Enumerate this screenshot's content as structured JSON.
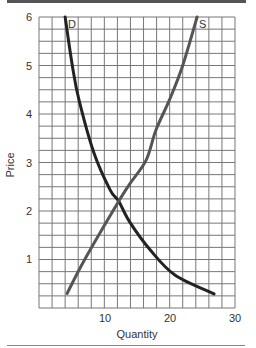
{
  "chart_data": {
    "type": "line",
    "title": "",
    "xlabel": "Quantity",
    "ylabel": "Price",
    "xlim": [
      0,
      30
    ],
    "ylim": [
      0,
      6
    ],
    "x_ticks": [
      10,
      20,
      30
    ],
    "y_ticks": [
      1,
      2,
      3,
      4,
      5,
      6
    ],
    "grid": true,
    "grid_x_step": 2,
    "grid_y_step": 0.25,
    "legend": "none (curves labeled inline)",
    "series": [
      {
        "name": "D",
        "label": "D",
        "color": "#222222",
        "points": [
          [
            4.0,
            6.0
          ],
          [
            5.1,
            5.0
          ],
          [
            6.1,
            4.3
          ],
          [
            8.4,
            3.2
          ],
          [
            10.9,
            2.43
          ],
          [
            12.2,
            2.2
          ],
          [
            13.9,
            1.77
          ],
          [
            17.0,
            1.2
          ],
          [
            20.8,
            0.68
          ],
          [
            26.8,
            0.29
          ]
        ]
      },
      {
        "name": "S",
        "label": "S",
        "color": "#555555",
        "points": [
          [
            4.3,
            0.3
          ],
          [
            7.0,
            1.0
          ],
          [
            12.2,
            2.2
          ],
          [
            13.9,
            2.56
          ],
          [
            16.4,
            3.05
          ],
          [
            17.9,
            3.67
          ],
          [
            20.0,
            4.3
          ],
          [
            22.0,
            5.0
          ],
          [
            24.2,
            6.0
          ]
        ]
      }
    ],
    "annotations": [
      "Curves intersect near Quantity ≈ 12, Price ≈ 2.2"
    ]
  },
  "labels": {
    "x_axis": "Quantity",
    "y_axis": "Price",
    "demand": "D",
    "supply": "S",
    "x_tick_10": "10",
    "x_tick_20": "20",
    "x_tick_30": "30",
    "y_tick_1": "1",
    "y_tick_2": "2",
    "y_tick_3": "3",
    "y_tick_4": "4",
    "y_tick_5": "5",
    "y_tick_6": "6"
  }
}
